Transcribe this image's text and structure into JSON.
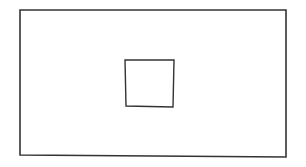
{
  "canvas": {
    "width": 306,
    "height": 167,
    "background": "#ffffff"
  },
  "stroke": {
    "color": "#333333",
    "outer_width": 1.6,
    "inner_width": 1.4
  },
  "shapes": {
    "outer_rectangle": {
      "label": "outer rectangle",
      "points": [
        [
          20,
          10
        ],
        [
          286,
          10
        ],
        [
          286,
          157
        ],
        [
          20,
          155
        ]
      ]
    },
    "inner_square": {
      "label": "inner square",
      "points": [
        [
          125,
          60
        ],
        [
          174,
          60
        ],
        [
          173,
          107
        ],
        [
          126,
          106
        ]
      ]
    }
  }
}
